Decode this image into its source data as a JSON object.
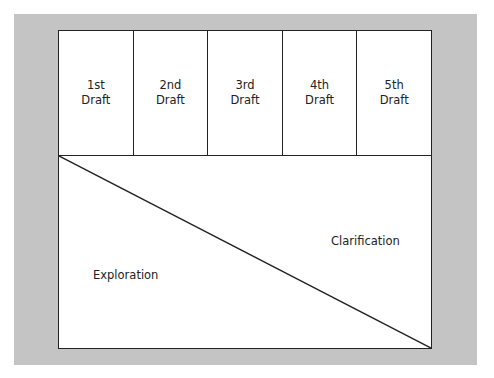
{
  "diagram": {
    "drafts": [
      {
        "label": "1st\nDraft"
      },
      {
        "label": "2nd\nDraft"
      },
      {
        "label": "3rd\nDraft"
      },
      {
        "label": "4th\nDraft"
      },
      {
        "label": "5th\nDraft"
      }
    ],
    "regions": {
      "lower_left": "Exploration",
      "upper_right": "Clarification"
    },
    "colors": {
      "panel_background": "#c4c4c4",
      "box_background": "#ffffff",
      "line": "#222222"
    }
  }
}
